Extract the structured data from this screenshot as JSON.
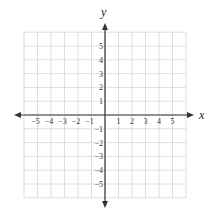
{
  "diagram": {
    "type": "coordinate-plane",
    "x_axis_label": "x",
    "y_axis_label": "y",
    "x_range": [
      -6,
      6
    ],
    "y_range": [
      -6,
      6
    ],
    "grid": true,
    "x_ticks": [
      "−5",
      "−4",
      "−3",
      "−2",
      "−1",
      "1",
      "2",
      "3",
      "4",
      "5"
    ],
    "y_ticks": [
      "5",
      "4",
      "3",
      "2",
      "1",
      "−1",
      "−2",
      "−3",
      "−4",
      "−5"
    ],
    "colors": {
      "grid": "#d6d6d6",
      "axis": "#333333",
      "background": "#ffffff"
    }
  }
}
